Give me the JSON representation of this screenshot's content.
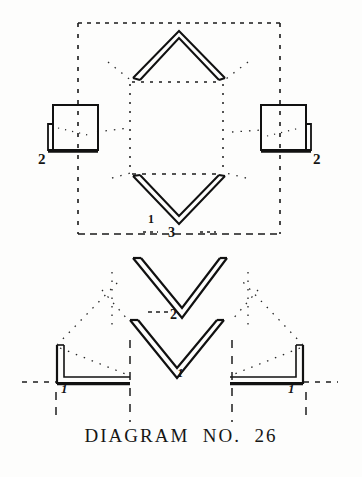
{
  "figure": {
    "caption": "DIAGRAM  NO.  26",
    "ink_color": "#121212",
    "paper_color": "#fdfdfc",
    "labels": {
      "left_square": "2",
      "right_square": "2",
      "middle_center": "3",
      "lower_center": "2",
      "tick_upper_center": "1",
      "tick_bottom_center": "1",
      "tick_bottom_left": "1",
      "tick_bottom_right": "1"
    },
    "parts": [
      {
        "name": "top-chevron",
        "shape": "chevron-up",
        "count": 1
      },
      {
        "name": "left-square-bracket",
        "shape": "square-with-flange",
        "count": 1,
        "label": "2"
      },
      {
        "name": "right-square-bracket",
        "shape": "square-with-flange",
        "count": 1,
        "label": "2"
      },
      {
        "name": "middle-chevron",
        "shape": "chevron-down",
        "count": 1,
        "label": "3"
      },
      {
        "name": "lower-chevron-upper",
        "shape": "chevron-down",
        "count": 1,
        "label": "2"
      },
      {
        "name": "lower-chevron-lower",
        "shape": "chevron-down",
        "count": 1
      },
      {
        "name": "bottom-left-angle",
        "shape": "L-angle",
        "count": 1,
        "label": "1"
      },
      {
        "name": "bottom-right-angle",
        "shape": "L-angle-mirrored",
        "count": 1,
        "label": "1"
      }
    ],
    "guides": {
      "outer_dashed_rect": {
        "x": 78,
        "y": 22,
        "width": 202,
        "height": 212
      },
      "inner_dotted_rect": {
        "x": 130,
        "y": 82,
        "width": 92,
        "height": 92
      }
    }
  }
}
